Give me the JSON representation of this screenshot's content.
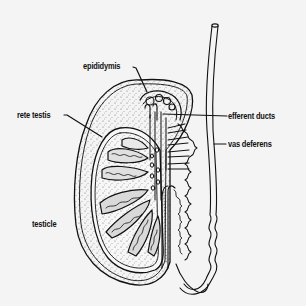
{
  "diagram": {
    "type": "anatomical-cross-section",
    "background_color": "#f4f4f4",
    "line_color": "#111111",
    "labels": [
      {
        "id": "epididymis",
        "text": "epididymis",
        "x": 83,
        "y": 61,
        "pointer": {
          "from": [
            134,
            67
          ],
          "to": [
            147,
            92
          ]
        }
      },
      {
        "id": "rete-testis",
        "text": "rete testis",
        "x": 17,
        "y": 110,
        "pointer": {
          "from": [
            65,
            115
          ],
          "to": [
            102,
            137
          ]
        }
      },
      {
        "id": "efferent-ducts",
        "text": "efferent ducts",
        "x": 228,
        "y": 110,
        "pointer": {
          "from": [
            226,
            116
          ],
          "to": [
            163,
            114
          ]
        }
      },
      {
        "id": "vas-deferens",
        "text": "vas deferens",
        "x": 228,
        "y": 138,
        "pointer": {
          "from": [
            226,
            144
          ],
          "to": [
            214,
            144
          ]
        }
      },
      {
        "id": "testicle",
        "text": "testicle",
        "x": 32,
        "y": 219,
        "pointer": null
      }
    ]
  }
}
